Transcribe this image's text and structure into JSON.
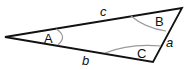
{
  "diagram": {
    "type": "triangle",
    "vertices": {
      "A": {
        "label": "A",
        "x": 5,
        "y": 37
      },
      "B": {
        "label": "B",
        "x": 182,
        "y": 8
      },
      "C": {
        "label": "C",
        "x": 153,
        "y": 62
      }
    },
    "sides": {
      "a": {
        "label": "a"
      },
      "b": {
        "label": "b"
      },
      "c": {
        "label": "c"
      }
    },
    "colors": {
      "stroke": "#111111",
      "arc": "#9a9a9a"
    }
  }
}
